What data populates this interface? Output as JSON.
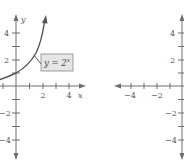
{
  "figures": [
    {
      "id": "left",
      "axis_labels": {
        "x": "x",
        "y": "y"
      },
      "x_tick_labels": [
        "2",
        "4"
      ],
      "y_tick_labels": [
        "4",
        "2",
        "−2",
        "−4"
      ],
      "curve_label": {
        "base": "y = 2",
        "exp": "x"
      },
      "curve": "y = 2^x"
    },
    {
      "id": "right",
      "x_tick_labels": [
        "−4",
        "−2"
      ],
      "y_tick_labels": [
        "4",
        "2",
        "−2",
        "−4"
      ]
    }
  ],
  "colors": {
    "axis": "#6e6e6e",
    "curve": "#555555",
    "label_box": "#e6e6e6"
  }
}
